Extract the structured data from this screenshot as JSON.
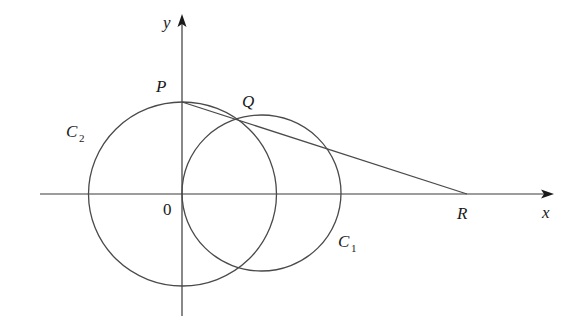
{
  "diagram": {
    "type": "geometry-figure",
    "axes": {
      "x_label": "x",
      "y_label": "y",
      "origin_label": "0"
    },
    "points": {
      "P": {
        "label": "P"
      },
      "Q": {
        "label": "Q"
      },
      "R": {
        "label": "R"
      }
    },
    "circles": [
      {
        "name": "C1",
        "label_main": "C",
        "label_sub": "1"
      },
      {
        "name": "C2",
        "label_main": "C",
        "label_sub": "2"
      }
    ],
    "segments": [
      {
        "from": "P",
        "to": "R"
      }
    ],
    "colors": {
      "stroke": "#4a4a4a",
      "text": "#1a1a1a",
      "background": "#ffffff"
    }
  }
}
